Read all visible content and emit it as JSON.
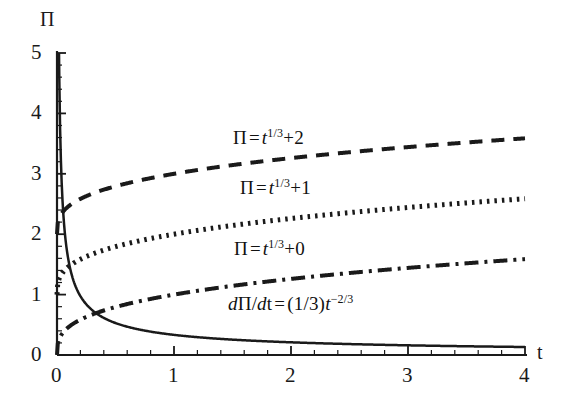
{
  "chart_data": {
    "type": "line",
    "title": "",
    "xlabel": "t",
    "ylabel": "Π",
    "xlim": [
      0,
      4
    ],
    "ylim": [
      0,
      5
    ],
    "grid": false,
    "legend_position": "inline-annotations",
    "xticks": [
      0,
      1,
      2,
      3,
      4
    ],
    "xtick_labels": [
      "0",
      "1",
      "2",
      "3",
      "4"
    ],
    "yticks": [
      0,
      1,
      2,
      3,
      4,
      5
    ],
    "ytick_labels": [
      "0",
      "1",
      "2",
      "3",
      "4",
      "5"
    ],
    "x_minor_ticks_per_unit": 5,
    "y_minor_ticks_per_unit": 5,
    "series": [
      {
        "name": "Pi = t^(1/3)+2",
        "formula": "cbrt+2",
        "offset": 2,
        "style": "dashed",
        "dash": "13,9",
        "width": 4,
        "color": "#1a1a1a",
        "points_x": [
          0,
          0.1,
          0.2,
          0.4,
          0.6,
          0.8,
          1,
          1.5,
          2,
          2.5,
          3,
          3.5,
          4
        ],
        "points_y": [
          2.0,
          2.46,
          2.58,
          2.74,
          2.84,
          2.93,
          3.0,
          3.14,
          3.26,
          3.36,
          3.44,
          3.52,
          3.59
        ]
      },
      {
        "name": "Pi = t^(1/3)+1",
        "formula": "cbrt+1",
        "offset": 1,
        "style": "dotted",
        "dash": "2.5,5",
        "width": 5,
        "color": "#1a1a1a",
        "points_x": [
          0,
          0.1,
          0.2,
          0.4,
          0.6,
          0.8,
          1,
          1.5,
          2,
          2.5,
          3,
          3.5,
          4
        ],
        "points_y": [
          1.0,
          1.46,
          1.58,
          1.74,
          1.84,
          1.93,
          2.0,
          2.14,
          2.26,
          2.36,
          2.44,
          2.52,
          2.59
        ]
      },
      {
        "name": "Pi = t^(1/3)+0",
        "formula": "cbrt+0",
        "offset": 0,
        "style": "dashdot",
        "dash": "14,6,3,6",
        "width": 4,
        "color": "#1a1a1a",
        "points_x": [
          0,
          0.1,
          0.2,
          0.4,
          0.6,
          0.8,
          1,
          1.5,
          2,
          2.5,
          3,
          3.5,
          4
        ],
        "points_y": [
          0.0,
          0.46,
          0.58,
          0.74,
          0.84,
          0.93,
          1.0,
          1.14,
          1.26,
          1.36,
          1.44,
          1.52,
          1.59
        ]
      },
      {
        "name": "dPi/dt = (1/3)t^(-2/3)",
        "formula": "deriv",
        "offset": 0,
        "style": "solid",
        "dash": "none",
        "width": 2.5,
        "color": "#1a1a1a",
        "points_x": [
          0.0045,
          0.02,
          0.05,
          0.1,
          0.2,
          0.3,
          0.5,
          0.75,
          1,
          1.5,
          2,
          2.5,
          3,
          3.5,
          4
        ],
        "points_y": [
          5.0,
          4.52,
          2.46,
          1.55,
          0.975,
          0.744,
          0.529,
          0.404,
          0.333,
          0.254,
          0.21,
          0.18,
          0.16,
          0.146,
          0.132
        ]
      }
    ]
  },
  "axes": {
    "y_axis_name": "Π",
    "x_axis_name": "t"
  },
  "annotations": [
    {
      "id": "label-dashed",
      "pi": "Π",
      "equals": "=",
      "var": "t",
      "exponent": "1/3",
      "plus": "+2",
      "x": 233,
      "y": 127
    },
    {
      "id": "label-dotted",
      "pi": "Π",
      "equals": "=",
      "var": "t",
      "exponent": "1/3",
      "plus": "+1",
      "x": 240,
      "y": 177
    },
    {
      "id": "label-dashdot",
      "pi": "Π",
      "equals": "=",
      "var": "t",
      "exponent": "1/3",
      "plus": "+0",
      "x": 234,
      "y": 238
    },
    {
      "id": "label-derivative",
      "d1": "d",
      "pi": "Π",
      "slash": "/",
      "d2": "d",
      "t": "t",
      "equals": "=",
      "frac": "(1/3)",
      "var": "t",
      "exponent": "−2/3",
      "x": 228,
      "y": 293
    }
  ]
}
